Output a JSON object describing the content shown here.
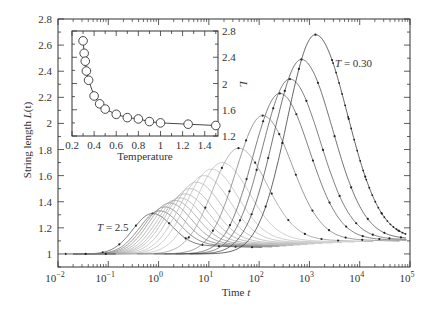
{
  "chart_data": [
    {
      "type": "line",
      "title": "",
      "xlabel": "Time t",
      "ylabel": "String length L(t)",
      "xscale": "log",
      "xlim": [
        0.01,
        100000
      ],
      "ylim": [
        0.9,
        2.8
      ],
      "xticks": [
        "10^-2",
        "10^-1",
        "10^0",
        "10^1",
        "10^2",
        "10^3",
        "10^4",
        "10^5"
      ],
      "yticks": [
        "1",
        "1.2",
        "1.4",
        "1.6",
        "1.8",
        "2",
        "2.2",
        "2.4",
        "2.6",
        "2.8"
      ],
      "grid": false,
      "annotations": [
        {
          "text": "T = 0.30",
          "near": "highest peak (rightmost curve)"
        },
        {
          "text": "T = 2.5",
          "near": "lowest peak (leftmost curve)"
        }
      ],
      "series_note": "Family of curves, one per temperature; peak log10(t) and peak L listed from T=2.5 (left) to T=0.30 (right). Lower temperatures drawn darker.",
      "series": [
        {
          "name": "T = 2.5",
          "peak_log10_t": -0.12,
          "peak_L": 1.31,
          "shade": "#444"
        },
        {
          "name": "T ≈ 2.2",
          "peak_log10_t": 0.02,
          "peak_L": 1.33,
          "shade": "#666"
        },
        {
          "name": "T ≈ 2.0",
          "peak_log10_t": 0.12,
          "peak_L": 1.36,
          "shade": "#777"
        },
        {
          "name": "T ≈ 1.8",
          "peak_log10_t": 0.22,
          "peak_L": 1.39,
          "shade": "#888"
        },
        {
          "name": "T ≈ 1.6",
          "peak_log10_t": 0.32,
          "peak_L": 1.41,
          "shade": "#999"
        },
        {
          "name": "T ≈ 1.5",
          "peak_log10_t": 0.42,
          "peak_L": 1.43,
          "shade": "#aaa"
        },
        {
          "name": "T ≈ 1.25",
          "peak_log10_t": 0.52,
          "peak_L": 1.46,
          "shade": "#aaa"
        },
        {
          "name": "T ≈ 1.0",
          "peak_log10_t": 0.62,
          "peak_L": 1.5,
          "shade": "#b0b0b0"
        },
        {
          "name": "T ≈ 0.9",
          "peak_log10_t": 0.75,
          "peak_L": 1.55,
          "shade": "#b0b0b0"
        },
        {
          "name": "T ≈ 0.8",
          "peak_log10_t": 0.9,
          "peak_L": 1.6,
          "shade": "#b8b8b8"
        },
        {
          "name": "T ≈ 0.7",
          "peak_log10_t": 1.05,
          "peak_L": 1.65,
          "shade": "#bbb"
        },
        {
          "name": "T ≈ 0.6",
          "peak_log10_t": 1.26,
          "peak_L": 1.7,
          "shade": "#bbb"
        },
        {
          "name": "T ≈ 0.5",
          "peak_log10_t": 1.59,
          "peak_L": 1.81,
          "shade": "#999"
        },
        {
          "name": "T ≈ 0.45",
          "peak_log10_t": 2.07,
          "peak_L": 2.06,
          "shade": "#777"
        },
        {
          "name": "T ≈ 0.40",
          "peak_log10_t": 2.41,
          "peak_L": 2.23,
          "shade": "#555"
        },
        {
          "name": "T ≈ 0.35",
          "peak_log10_t": 2.61,
          "peak_L": 2.34,
          "shade": "#555"
        },
        {
          "name": "T ≈ 0.33",
          "peak_log10_t": 2.84,
          "peak_L": 2.49,
          "shade": "#444"
        },
        {
          "name": "T = 0.30",
          "peak_log10_t": 3.12,
          "peak_L": 2.68,
          "shade": "#333"
        }
      ],
      "inset": {
        "type": "line",
        "xlabel": "Temperature",
        "ylabel": "L",
        "xlim": [
          0.2,
          1.52
        ],
        "ylim": [
          1.2,
          2.8
        ],
        "xticks": [
          "0.2",
          "0.4",
          "0.6",
          "0.8",
          "1",
          "1.2",
          "1.4"
        ],
        "yticks": [
          "1.2",
          "1.6",
          "2",
          "2.4",
          "2.8"
        ],
        "marker": "open-circle",
        "x": [
          0.3,
          0.31,
          0.32,
          0.33,
          0.35,
          0.4,
          0.45,
          0.5,
          0.6,
          0.7,
          0.8,
          0.9,
          1.0,
          1.25,
          1.5
        ],
        "y": [
          2.65,
          2.46,
          2.34,
          2.19,
          2.05,
          1.81,
          1.69,
          1.61,
          1.53,
          1.48,
          1.46,
          1.42,
          1.4,
          1.38,
          1.36
        ]
      }
    }
  ],
  "labels": {
    "xlabel_main": "Time ",
    "xlabel_var": "t",
    "ylabel_main": "String length ",
    "ylabel_var": "L",
    "ylabel_arg": "(t)",
    "annot_low": "T",
    "annot_low_val": " = 2.5",
    "annot_high": "T",
    "annot_high_val": " = 0.30",
    "inset_xlabel": "Temperature",
    "inset_ylabel": "L"
  }
}
